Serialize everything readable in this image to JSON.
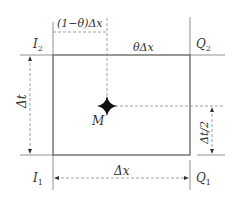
{
  "diagram": {
    "labels": {
      "one_minus_theta_dx": "(1−θ)Δx",
      "theta_dx": "θΔx",
      "I2": "I",
      "I2_sub": "2",
      "Q2": "Q",
      "Q2_sub": "2",
      "I1": "I",
      "I1_sub": "1",
      "Q1": "Q",
      "Q1_sub": "1",
      "dt": "Δt",
      "dt_half": "Δt/2",
      "dx": "Δx",
      "M": "M"
    },
    "colors": {
      "line": "#555555",
      "dash": "#888888",
      "marker": "#111111",
      "text": "#333333"
    }
  }
}
